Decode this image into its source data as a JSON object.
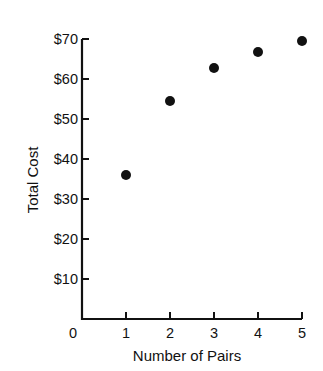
{
  "chart_data": {
    "type": "scatter",
    "title": "",
    "xlabel": "Number of Pairs",
    "ylabel": "Total Cost",
    "x": [
      1,
      2,
      3,
      4,
      5
    ],
    "series": [
      {
        "name": "Total Cost",
        "values": [
          36,
          54.5,
          62.75,
          66.75,
          69.5
        ]
      }
    ],
    "x_ticks": [
      "0",
      "1",
      "2",
      "3",
      "4",
      "5"
    ],
    "y_ticks": [
      "$10",
      "$20",
      "$30",
      "$40",
      "$50",
      "$60",
      "$70"
    ],
    "xlim": [
      0,
      5
    ],
    "ylim": [
      0,
      70
    ],
    "grid": false,
    "legend": "none",
    "marker_color": "#111111"
  },
  "labels": {
    "xlabel": "Number of Pairs",
    "ylabel": "Total Cost",
    "origin": "0",
    "x_ticks": [
      "1",
      "2",
      "3",
      "4",
      "5"
    ],
    "y_ticks": [
      "$10",
      "$20",
      "$30",
      "$40",
      "$50",
      "$60",
      "$70"
    ]
  }
}
